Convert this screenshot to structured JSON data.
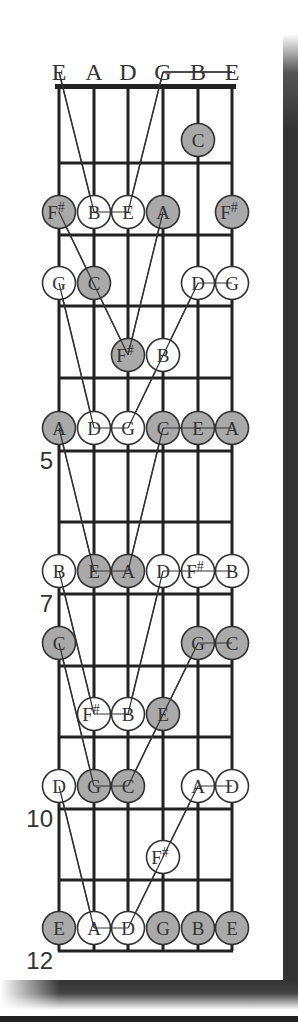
{
  "diagram": {
    "title": "",
    "strings": [
      "E",
      "A",
      "D",
      "G",
      "B",
      "E"
    ],
    "fret_labels": [
      {
        "fret": 5,
        "label": "5"
      },
      {
        "fret": 7,
        "label": "7"
      },
      {
        "fret": 10,
        "label": "10"
      },
      {
        "fret": 12,
        "label": "12"
      }
    ],
    "colors": {
      "filled_dot": "#a9a9a9",
      "open_dot": "#ffffff",
      "line": "#222222",
      "text": "#333333"
    },
    "notes": [
      {
        "fret": 1,
        "string": 4,
        "note": "C",
        "filled": true
      },
      {
        "fret": 2,
        "string": 0,
        "note": "F#",
        "filled": true
      },
      {
        "fret": 2,
        "string": 1,
        "note": "B",
        "filled": false
      },
      {
        "fret": 2,
        "string": 2,
        "note": "E",
        "filled": false
      },
      {
        "fret": 2,
        "string": 3,
        "note": "A",
        "filled": true
      },
      {
        "fret": 2,
        "string": 5,
        "note": "F#",
        "filled": true
      },
      {
        "fret": 3,
        "string": 0,
        "note": "G",
        "filled": false
      },
      {
        "fret": 3,
        "string": 1,
        "note": "C",
        "filled": true
      },
      {
        "fret": 3,
        "string": 4,
        "note": "D",
        "filled": false
      },
      {
        "fret": 3,
        "string": 5,
        "note": "G",
        "filled": false
      },
      {
        "fret": 4,
        "string": 2,
        "note": "F#",
        "filled": true
      },
      {
        "fret": 4,
        "string": 3,
        "note": "B",
        "filled": false
      },
      {
        "fret": 5,
        "string": 0,
        "note": "A",
        "filled": true
      },
      {
        "fret": 5,
        "string": 1,
        "note": "D",
        "filled": false
      },
      {
        "fret": 5,
        "string": 2,
        "note": "G",
        "filled": false
      },
      {
        "fret": 5,
        "string": 3,
        "note": "C",
        "filled": true
      },
      {
        "fret": 5,
        "string": 4,
        "note": "E",
        "filled": true
      },
      {
        "fret": 5,
        "string": 5,
        "note": "A",
        "filled": true
      },
      {
        "fret": 7,
        "string": 0,
        "note": "B",
        "filled": false
      },
      {
        "fret": 7,
        "string": 1,
        "note": "E",
        "filled": true
      },
      {
        "fret": 7,
        "string": 2,
        "note": "A",
        "filled": true
      },
      {
        "fret": 7,
        "string": 3,
        "note": "D",
        "filled": false
      },
      {
        "fret": 7,
        "string": 4,
        "note": "F#",
        "filled": false
      },
      {
        "fret": 7,
        "string": 5,
        "note": "B",
        "filled": false
      },
      {
        "fret": 8,
        "string": 0,
        "note": "C",
        "filled": true
      },
      {
        "fret": 8,
        "string": 4,
        "note": "G",
        "filled": true
      },
      {
        "fret": 8,
        "string": 5,
        "note": "C",
        "filled": true
      },
      {
        "fret": 9,
        "string": 1,
        "note": "F#",
        "filled": false
      },
      {
        "fret": 9,
        "string": 2,
        "note": "B",
        "filled": false
      },
      {
        "fret": 9,
        "string": 3,
        "note": "E",
        "filled": true
      },
      {
        "fret": 10,
        "string": 0,
        "note": "D",
        "filled": false
      },
      {
        "fret": 10,
        "string": 1,
        "note": "G",
        "filled": true
      },
      {
        "fret": 10,
        "string": 2,
        "note": "C",
        "filled": true
      },
      {
        "fret": 10,
        "string": 4,
        "note": "A",
        "filled": false
      },
      {
        "fret": 10,
        "string": 5,
        "note": "D",
        "filled": false
      },
      {
        "fret": 11,
        "string": 3,
        "note": "F#",
        "filled": false
      },
      {
        "fret": 12,
        "string": 0,
        "note": "E",
        "filled": true
      },
      {
        "fret": 12,
        "string": 1,
        "note": "A",
        "filled": false
      },
      {
        "fret": 12,
        "string": 2,
        "note": "D",
        "filled": false
      },
      {
        "fret": 12,
        "string": 3,
        "note": "G",
        "filled": true
      },
      {
        "fret": 12,
        "string": 4,
        "note": "B",
        "filled": true
      },
      {
        "fret": 12,
        "string": 5,
        "note": "E",
        "filled": true
      }
    ],
    "connections": [
      {
        "from": [
          0,
          0
        ],
        "to": [
          2,
          1
        ]
      },
      {
        "from": [
          0,
          3
        ],
        "to": [
          2,
          2
        ]
      },
      {
        "from": [
          0,
          3
        ],
        "to": [
          0,
          5
        ]
      },
      {
        "from": [
          2,
          1
        ],
        "to": [
          2,
          2
        ]
      },
      {
        "from": [
          2,
          0
        ],
        "to": [
          4,
          2
        ]
      },
      {
        "from": [
          2,
          3
        ],
        "to": [
          4,
          2
        ]
      },
      {
        "from": [
          3,
          0
        ],
        "to": [
          5,
          1
        ]
      },
      {
        "from": [
          3,
          4
        ],
        "to": [
          3,
          5
        ]
      },
      {
        "from": [
          3,
          4
        ],
        "to": [
          5,
          2
        ]
      },
      {
        "from": [
          5,
          1
        ],
        "to": [
          5,
          2
        ]
      },
      {
        "from": [
          5,
          3
        ],
        "to": [
          5,
          5
        ]
      },
      {
        "from": [
          5,
          0
        ],
        "to": [
          7,
          1
        ]
      },
      {
        "from": [
          5,
          3
        ],
        "to": [
          7,
          2
        ]
      },
      {
        "from": [
          7,
          1
        ],
        "to": [
          7,
          2
        ]
      },
      {
        "from": [
          7,
          3
        ],
        "to": [
          7,
          5
        ]
      },
      {
        "from": [
          7,
          0
        ],
        "to": [
          9,
          1
        ]
      },
      {
        "from": [
          7,
          3
        ],
        "to": [
          9,
          2
        ]
      },
      {
        "from": [
          8,
          4
        ],
        "to": [
          8,
          5
        ]
      },
      {
        "from": [
          8,
          0
        ],
        "to": [
          10,
          1
        ]
      },
      {
        "from": [
          8,
          4
        ],
        "to": [
          10,
          2
        ]
      },
      {
        "from": [
          9,
          1
        ],
        "to": [
          9,
          2
        ]
      },
      {
        "from": [
          10,
          1
        ],
        "to": [
          10,
          2
        ]
      },
      {
        "from": [
          10,
          4
        ],
        "to": [
          10,
          5
        ]
      },
      {
        "from": [
          10,
          0
        ],
        "to": [
          12,
          1
        ]
      },
      {
        "from": [
          10,
          4
        ],
        "to": [
          12,
          2
        ]
      },
      {
        "from": [
          12,
          1
        ],
        "to": [
          12,
          2
        ]
      }
    ]
  }
}
